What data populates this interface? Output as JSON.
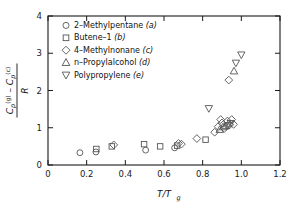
{
  "chart_data": {
    "type": "scatter",
    "title": "",
    "xlabel": "T/Tg",
    "xlabel_parts": {
      "numerator": "T",
      "denominator": "T",
      "denominator_sub": "g"
    },
    "ylabel": "(Cp(g) - Cp(c)) / R",
    "ylabel_parts": {
      "num_sym1": "C",
      "num_sub1": "p",
      "num_sup1": "(g)",
      "minus": "–",
      "num_sym2": "C",
      "num_sub2": "p",
      "num_sup2": "(c)",
      "denominator": "R"
    },
    "xlim": [
      0,
      1.2
    ],
    "ylim": [
      0,
      4
    ],
    "xticks": [
      0,
      0.2,
      0.4,
      0.6,
      0.8,
      1.0,
      1.2
    ],
    "xticklabels": [
      "0",
      "0.2",
      "0.4",
      "0.6",
      "0.8",
      "1.0",
      "1.2"
    ],
    "yticks": [
      0,
      1,
      2,
      3,
      4
    ],
    "yticklabels": [
      "0",
      "1",
      "2",
      "3",
      "4"
    ],
    "grid": false,
    "legend_position": "upper-left",
    "marker_color": "#555555",
    "series": [
      {
        "name": "2-Methylpentane",
        "tag": "a",
        "marker": "circle",
        "points": [
          {
            "x": 0.165,
            "y": 0.33
          },
          {
            "x": 0.248,
            "y": 0.35
          },
          {
            "x": 0.505,
            "y": 0.4
          },
          {
            "x": 0.655,
            "y": 0.46
          }
        ]
      },
      {
        "name": "Butene-1",
        "tag": "b",
        "marker": "square",
        "points": [
          {
            "x": 0.25,
            "y": 0.43
          },
          {
            "x": 0.33,
            "y": 0.5
          },
          {
            "x": 0.497,
            "y": 0.56
          },
          {
            "x": 0.58,
            "y": 0.5
          },
          {
            "x": 0.668,
            "y": 0.52
          },
          {
            "x": 0.815,
            "y": 0.68
          }
        ]
      },
      {
        "name": "4-Methylnonane",
        "tag": "c",
        "marker": "diamond",
        "points": [
          {
            "x": 0.34,
            "y": 0.54
          },
          {
            "x": 0.675,
            "y": 0.58
          },
          {
            "x": 0.69,
            "y": 0.56
          },
          {
            "x": 0.77,
            "y": 0.71
          },
          {
            "x": 0.862,
            "y": 0.88
          },
          {
            "x": 0.88,
            "y": 1.03
          },
          {
            "x": 0.893,
            "y": 1.22
          },
          {
            "x": 0.9,
            "y": 1.13
          },
          {
            "x": 0.912,
            "y": 0.98
          },
          {
            "x": 0.928,
            "y": 1.18
          },
          {
            "x": 0.94,
            "y": 1.08
          },
          {
            "x": 0.95,
            "y": 1.22
          },
          {
            "x": 0.96,
            "y": 1.09
          },
          {
            "x": 0.935,
            "y": 2.28
          }
        ]
      },
      {
        "name": "n-Propylalcohol",
        "tag": "d",
        "marker": "triangle-up",
        "points": [
          {
            "x": 0.888,
            "y": 0.95
          },
          {
            "x": 0.905,
            "y": 1.02
          },
          {
            "x": 0.92,
            "y": 1.05
          },
          {
            "x": 0.962,
            "y": 2.52
          }
        ]
      },
      {
        "name": "Polypropylene",
        "tag": "e",
        "marker": "triangle-down",
        "points": [
          {
            "x": 0.832,
            "y": 1.52
          },
          {
            "x": 0.93,
            "y": 1.06
          },
          {
            "x": 0.945,
            "y": 1.12
          },
          {
            "x": 0.972,
            "y": 2.74
          },
          {
            "x": 1.0,
            "y": 2.96
          }
        ]
      }
    ]
  },
  "legend": {
    "items": [
      {
        "label": "2–Methylpentane",
        "tag": "(a)",
        "marker": "circle"
      },
      {
        "label": "Butene–1",
        "tag": "(b)",
        "marker": "square"
      },
      {
        "label": "4–Methylnonane",
        "tag": "(c)",
        "marker": "diamond"
      },
      {
        "label": "n–Propylalcohol",
        "tag": "(d)",
        "marker": "triangle-up"
      },
      {
        "label": "Polypropylene",
        "tag": "(e)",
        "marker": "triangle-down"
      }
    ]
  }
}
